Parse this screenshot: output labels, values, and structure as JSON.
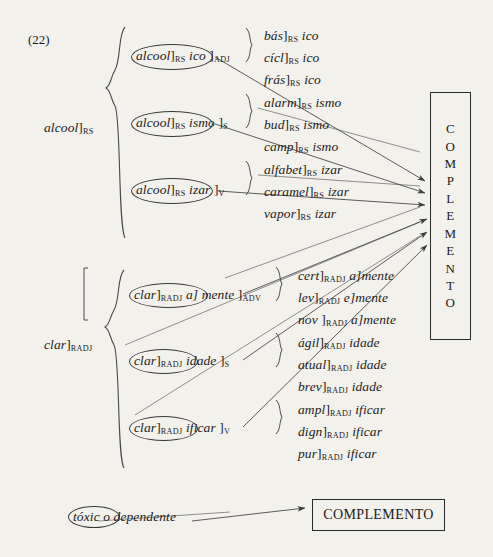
{
  "page": {
    "example_number": "(22)",
    "background_color": "#f3f1ec",
    "ink_color": "#1b1b1b"
  },
  "targets": {
    "vertical_box_label": "COMPLEMENTO",
    "vertical_box_letters": [
      "C",
      "O",
      "M",
      "P",
      "L",
      "E",
      "M",
      "E",
      "N",
      "T",
      "O"
    ],
    "bottom_box_label": "COMPLEMENTO"
  },
  "block_upper": {
    "base_label": {
      "stem": "alcool",
      "bracket": "]",
      "subscript": "RS"
    },
    "branches": [
      {
        "pattern": {
          "stem": "alcool",
          "bracket1": "]",
          "sub1": "RS",
          "suffix": "ico",
          "bracket2": "]",
          "sub2": "ADJ"
        },
        "examples": [
          {
            "stem": "bás",
            "bracket": "]",
            "sub": "RS",
            "suffix": "ico"
          },
          {
            "stem": "cícl",
            "bracket": "]",
            "sub": "RS",
            "suffix": "ico"
          },
          {
            "stem": "frás",
            "bracket": "]",
            "sub": "RS",
            "suffix": "ico"
          }
        ]
      },
      {
        "pattern": {
          "stem": "alcool",
          "bracket1": "]",
          "sub1": "RS",
          "suffix": "ismo",
          "bracket2": "]",
          "sub2": "S"
        },
        "examples": [
          {
            "stem": "alarm",
            "bracket": "]",
            "sub": "RS",
            "suffix": "ismo"
          },
          {
            "stem": "bud",
            "bracket": "]",
            "sub": "RS",
            "suffix": "ismo"
          },
          {
            "stem": "camp",
            "bracket": "]",
            "sub": "RS",
            "suffix": "ismo"
          }
        ]
      },
      {
        "pattern": {
          "stem": "alcool",
          "bracket1": "]",
          "sub1": "RS",
          "suffix": "izar",
          "bracket2": "]",
          "sub2": "V"
        },
        "examples": [
          {
            "stem": "alfabet",
            "bracket": "]",
            "sub": "RS",
            "suffix": "izar"
          },
          {
            "stem": "caramel",
            "bracket": "]",
            "sub": "RS",
            "suffix": "izar"
          },
          {
            "stem": "vapor",
            "bracket": "]",
            "sub": "RS",
            "suffix": "izar"
          }
        ]
      }
    ]
  },
  "block_lower": {
    "base_label": {
      "stem": "clar",
      "bracket": "]",
      "subscript": "RADJ"
    },
    "branches": [
      {
        "pattern": {
          "stem": "clar",
          "bracket1": "]",
          "sub1": "RADJ",
          "infix": "a]",
          "suffix": "mente",
          "bracket2": "]",
          "sub2": "ADV"
        },
        "examples": [
          {
            "stem": "cert",
            "bracket": "]",
            "sub": "RADJ",
            "suffix": "a]mente"
          },
          {
            "stem": "lev",
            "bracket": "]",
            "sub": "RADJ",
            "suffix": "e]mente"
          },
          {
            "stem": "nov ",
            "bracket": "]",
            "sub": "RADJ",
            "suffix": "a]mente"
          }
        ]
      },
      {
        "pattern": {
          "stem": "clar",
          "bracket1": "]",
          "sub1": "RADJ",
          "suffix": "idade",
          "bracket2": "]",
          "sub2": "S"
        },
        "examples": [
          {
            "stem": "ágil",
            "bracket": "]",
            "sub": "RADJ",
            "suffix": "idade"
          },
          {
            "stem": "atual",
            "bracket": "]",
            "sub": "RADJ",
            "suffix": "idade"
          },
          {
            "stem": "brev",
            "bracket": "]",
            "sub": "RADJ",
            "suffix": "idade"
          }
        ]
      },
      {
        "pattern": {
          "stem": "clar",
          "bracket1": "]",
          "sub1": "RADJ",
          "suffix": "ificar",
          "bracket2": "]",
          "sub2": "V"
        },
        "examples": [
          {
            "stem": "ampl",
            "bracket": "]",
            "sub": "RADJ",
            "suffix": "ificar"
          },
          {
            "stem": "dign",
            "bracket": "]",
            "sub": "RADJ",
            "suffix": "ificar"
          },
          {
            "stem": "pur",
            "bracket": "]",
            "sub": "RADJ",
            "suffix": "ificar"
          }
        ]
      }
    ]
  },
  "bottom_row": {
    "circled_word": "tóxic",
    "rest_text": "o dependente"
  }
}
